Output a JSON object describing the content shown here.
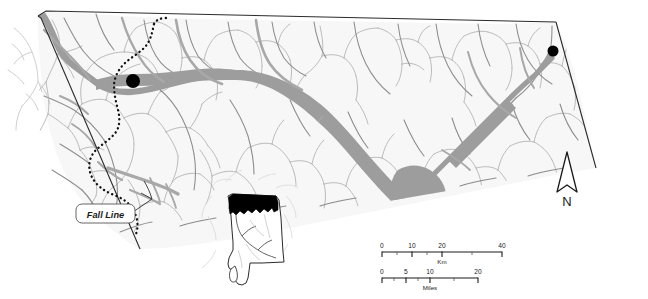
{
  "map": {
    "title": "North Alabama Tennessee River Valley study area map",
    "colors": {
      "land_fill": "#f7f7f7",
      "boundary_stroke": "#2b2b2b",
      "river_major": "#9a9a9a",
      "river_minor": "#b4b4b4",
      "tributary": "#8e8e8e",
      "site_marker": "#000000",
      "inset_highlight": "#000000",
      "callout_fill": "#ffffff",
      "text": "#1a1a1a"
    },
    "annotations": {
      "fall_line_label": "Fall Line"
    },
    "site_markers": [
      {
        "name": "site-marker-west",
        "x": 133,
        "y": 81,
        "r": 7
      },
      {
        "name": "site-marker-east",
        "x": 553,
        "y": 51,
        "r": 5.5
      }
    ],
    "north_arrow": {
      "label": "N"
    },
    "scale_bars": [
      {
        "unit": "Km",
        "ticks": [
          "0",
          "10",
          "20",
          "40"
        ],
        "tick_positions": [
          0,
          30,
          60,
          120
        ],
        "minor_positions": [
          15,
          45,
          90
        ],
        "length": 120
      },
      {
        "unit": "Miles",
        "ticks": [
          "0",
          "5",
          "10",
          "20"
        ],
        "tick_positions": [
          0,
          24,
          48,
          96
        ],
        "minor_positions": [
          12,
          36,
          72
        ],
        "length": 96
      }
    ],
    "inset": {
      "name": "alabama-state-inset",
      "highlight_description": "northern-alabama-shaded"
    }
  }
}
